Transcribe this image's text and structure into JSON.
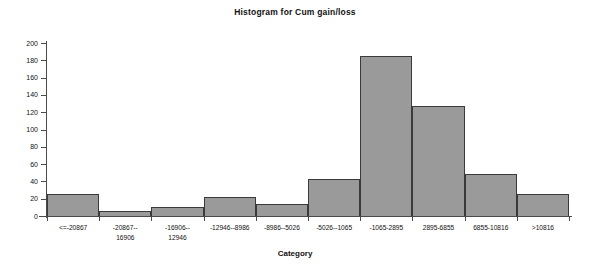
{
  "chart_data": {
    "type": "bar",
    "title": "Histogram for Cum gain/loss",
    "xlabel": "Category",
    "ylabel": "",
    "ylim": [
      0,
      200
    ],
    "ytick_step": 20,
    "yticks": [
      0,
      20,
      40,
      60,
      80,
      100,
      120,
      140,
      160,
      180,
      200
    ],
    "grid": false,
    "legend": null,
    "categories": [
      "<=-20867",
      "-20867--16906",
      "-16906--12946",
      "-12946--8986",
      "-8986--5026",
      "-5026--1065",
      "-1065-2895",
      "2895-6855",
      "6855-10816",
      ">10816"
    ],
    "category_labels_display": [
      "<=-20867",
      "-20867--\n16906",
      "-16906--\n12946",
      "-12946--8986",
      "-8986--5026",
      "-5026--1065",
      "-1065-2895",
      "2895-6855",
      "6855-10816",
      ">10816"
    ],
    "values": [
      25,
      6,
      10,
      22,
      14,
      43,
      185,
      127,
      49,
      25
    ],
    "bar_fill_color": "#9a9a9a",
    "bar_border_color": "#3a3a3a",
    "axis_color": "#4a4a4a",
    "background_color": "#ffffff"
  }
}
